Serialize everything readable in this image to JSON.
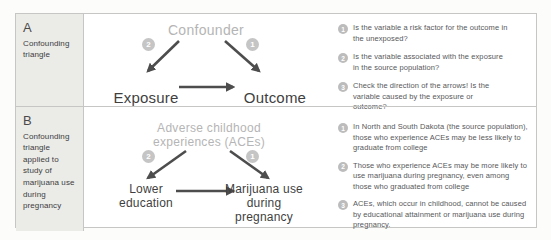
{
  "panels": [
    {
      "id": "A",
      "title": "Confounding triangle",
      "diagram": {
        "top_label": "Confounder",
        "left_label": "Exposure",
        "right_label": "Outcome",
        "left_badge": "2",
        "right_badge": "1"
      },
      "notes": [
        {
          "num": "1",
          "text": "Is the variable a risk factor for the outcome in the unexposed?"
        },
        {
          "num": "2",
          "text": "Is the variable associated with the exposure in the source population?"
        },
        {
          "num": "3",
          "text": "Check the direction of the arrows! Is the variable caused by the exposure or outcome?"
        }
      ]
    },
    {
      "id": "B",
      "title": "Confounding triangle applied to study of marijuana use during pregnancy",
      "diagram": {
        "top_label": "Adverse childhood experiences (ACEs)",
        "left_label": "Lower education",
        "right_label": "Marijuana use during pregnancy",
        "left_badge": "2",
        "right_badge": "1"
      },
      "notes": [
        {
          "num": "1",
          "text": "In North and South Dakota (the source population), those who experience ACEs may be less likely to graduate from college"
        },
        {
          "num": "2",
          "text": "Those who experience ACEs may be more likely to use marijuana during pregnancy, even among those who graduated from college"
        },
        {
          "num": "3",
          "text": "ACEs, which occur in childhood, cannot be caused by educational attainment or marijuana use during pregnancy."
        }
      ]
    }
  ],
  "colors": {
    "arrow": "#4d4d4d",
    "confounder_text": "#b5b5b5",
    "badge_bg": "#c5c5c5",
    "note_badge_bg": "#bcbcbc",
    "border": "#c6c6c4",
    "label_column_bg": "#ebebe8"
  }
}
